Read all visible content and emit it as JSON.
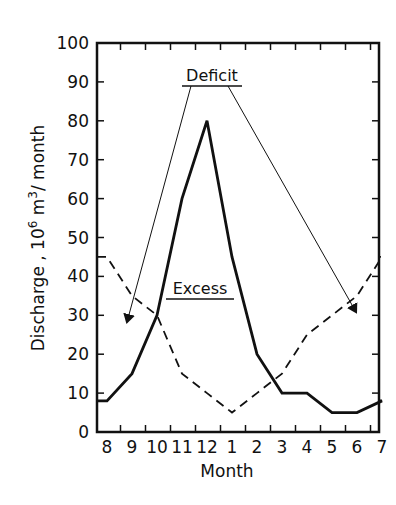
{
  "chart_data": {
    "type": "line",
    "title": "",
    "xlabel": "Month",
    "ylabel": "Discharge , 10^6 m^3/ month",
    "ylabel_parts": {
      "main": "Discharge ,  10",
      "sup1": "6",
      "mid": " m",
      "sup2": "3",
      "end": "/ month"
    },
    "categories": [
      "8",
      "9",
      "10",
      "11",
      "12",
      "1",
      "2",
      "3",
      "4",
      "5",
      "6",
      "7"
    ],
    "ylim": [
      0,
      100
    ],
    "yticks": [
      0,
      10,
      20,
      30,
      40,
      50,
      60,
      70,
      80,
      90,
      100
    ],
    "grid": false,
    "series": [
      {
        "name": "Discharge (solid)",
        "style": "solid",
        "values": [
          8,
          15,
          30,
          60,
          80,
          45,
          20,
          10,
          10,
          5,
          5,
          8
        ]
      },
      {
        "name": "Demand (dashed)",
        "style": "dashed",
        "values": [
          45,
          35,
          30,
          15,
          10,
          5,
          10,
          15,
          25,
          30,
          35,
          45
        ]
      }
    ],
    "annotations": [
      {
        "text": "Deficit",
        "underlined": true,
        "arrows_to": [
          "9",
          "6"
        ]
      },
      {
        "text": "Excess",
        "underlined": true
      }
    ]
  }
}
